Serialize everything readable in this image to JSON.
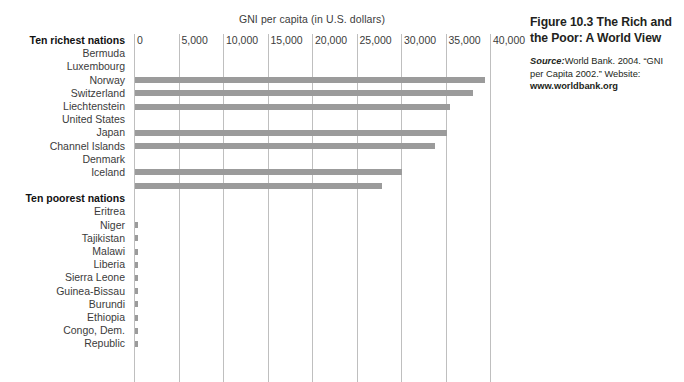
{
  "chart_data": {
    "type": "bar",
    "orientation": "horizontal",
    "title": "GNI per capita (in U.S. dollars)",
    "xlabel": "",
    "ylabel": "",
    "xlim": [
      0,
      40000
    ],
    "xticks": [
      "0",
      "5,000",
      "10,000",
      "15,000",
      "20,000",
      "25,000",
      "30,000",
      "35,000",
      "40,000"
    ],
    "xtick_values": [
      0,
      5000,
      10000,
      15000,
      20000,
      25000,
      30000,
      35000,
      40000
    ],
    "grid": "vertical",
    "legend": "none",
    "bar_color": "#9b9b9b",
    "groups": [
      {
        "name": "Ten richest nations",
        "categories": [
          "Bermuda",
          "Luxembourg",
          "Norway",
          "Switzerland",
          "Liechtenstein",
          "United States",
          "Japan",
          "Channel Islands",
          "Denmark",
          "Iceland"
        ],
        "values": [
          0,
          39300,
          38000,
          35400,
          0,
          35000,
          33700,
          0,
          30000,
          27800
        ]
      },
      {
        "name": "Ten poorest nations",
        "categories": [
          "Eritrea",
          "Niger",
          "Tajikistan",
          "Malawi",
          "Liberia",
          "Sierra Leone",
          "Guinea-Bissau",
          "Burundi",
          "Ethiopia",
          "Congo, Dem.",
          "Republic"
        ],
        "values": [
          190,
          180,
          180,
          160,
          150,
          150,
          140,
          100,
          100,
          100,
          null
        ]
      }
    ]
  },
  "chart": {
    "title": "GNI per capita (in U.S. dollars)",
    "ticks": [
      "0",
      "5,000",
      "10,000",
      "15,000",
      "20,000",
      "25,000",
      "30,000",
      "35,000",
      "40,000"
    ],
    "rows": [
      {
        "label": "Ten richest nations",
        "kind": "group",
        "value": null
      },
      {
        "label": "Bermuda",
        "kind": "item",
        "value": 0
      },
      {
        "label": "Luxembourg",
        "kind": "item",
        "value": 39300
      },
      {
        "label": "Norway",
        "kind": "item",
        "value": 38000
      },
      {
        "label": "Switzerland",
        "kind": "item",
        "value": 35400
      },
      {
        "label": "Liechtenstein",
        "kind": "item",
        "value": 0
      },
      {
        "label": "United States",
        "kind": "item",
        "value": 35000
      },
      {
        "label": "Japan",
        "kind": "item",
        "value": 33700
      },
      {
        "label": "Channel Islands",
        "kind": "item",
        "value": 0
      },
      {
        "label": "Denmark",
        "kind": "item",
        "value": 30000
      },
      {
        "label": "Iceland",
        "kind": "item",
        "value": 27800
      },
      {
        "label": "",
        "kind": "spacer",
        "value": null
      },
      {
        "label": "Ten poorest nations",
        "kind": "group",
        "value": null
      },
      {
        "label": "Eritrea",
        "kind": "item",
        "value": 190
      },
      {
        "label": "Niger",
        "kind": "item",
        "value": 180
      },
      {
        "label": "Tajikistan",
        "kind": "item",
        "value": 180
      },
      {
        "label": "Malawi",
        "kind": "item",
        "value": 160
      },
      {
        "label": "Liberia",
        "kind": "item",
        "value": 150
      },
      {
        "label": "Sierra Leone",
        "kind": "item",
        "value": 150
      },
      {
        "label": "Guinea-Bissau",
        "kind": "item",
        "value": 140
      },
      {
        "label": "Burundi",
        "kind": "item",
        "value": 100
      },
      {
        "label": "Ethiopia",
        "kind": "item",
        "value": 100
      },
      {
        "label": "Congo, Dem.",
        "kind": "item",
        "value": 100
      },
      {
        "label": "Republic",
        "kind": "item",
        "value": null
      }
    ]
  },
  "caption": {
    "figure_number": "Figure 10.3",
    "title": "The Rich and the Poor: A World View",
    "source_lead": "Source:",
    "source_text": "World Bank. 2004. “GNI per Capita 2002.” Website: ",
    "source_url": "www.worldbank.org"
  },
  "colors": {
    "bar": "#9b9b9b",
    "gridline": "#bfbfbf",
    "axis": "#9a9a9a",
    "text": "#231f20",
    "background": "#ffffff"
  }
}
